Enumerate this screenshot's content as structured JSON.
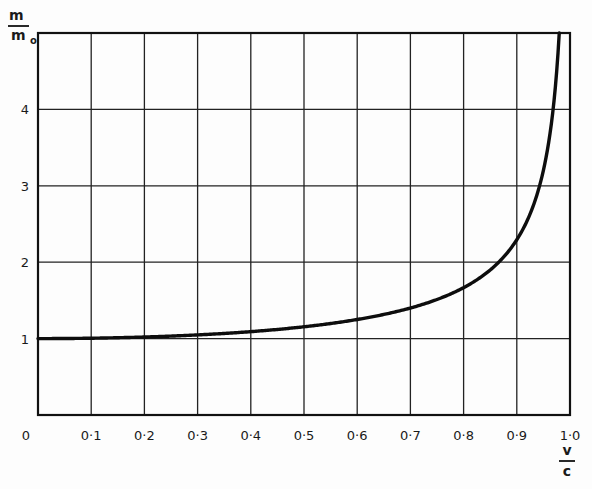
{
  "chart_data": {
    "type": "line",
    "title": "",
    "xlabel": {
      "numerator": "v",
      "denominator": "c"
    },
    "ylabel": {
      "numerator": "m",
      "denominator": "m",
      "denominator_subscript": "o"
    },
    "xlim": [
      0,
      1.0
    ],
    "ylim": [
      0,
      5
    ],
    "grid": true,
    "legend": null,
    "x_ticks": [
      {
        "value": 0,
        "label": "0"
      },
      {
        "value": 0.1,
        "label": "0·1"
      },
      {
        "value": 0.2,
        "label": "0·2"
      },
      {
        "value": 0.3,
        "label": "0·3"
      },
      {
        "value": 0.4,
        "label": "0·4"
      },
      {
        "value": 0.5,
        "label": "0·5"
      },
      {
        "value": 0.6,
        "label": "0·6"
      },
      {
        "value": 0.7,
        "label": "0·7"
      },
      {
        "value": 0.8,
        "label": "0·8"
      },
      {
        "value": 0.9,
        "label": "0·9"
      },
      {
        "value": 1.0,
        "label": "1·0"
      }
    ],
    "y_ticks": [
      {
        "value": 1,
        "label": "1"
      },
      {
        "value": 2,
        "label": "2"
      },
      {
        "value": 3,
        "label": "3"
      },
      {
        "value": 4,
        "label": "4"
      }
    ],
    "series": [
      {
        "name": "m/m0 = 1/sqrt(1 - v²/c²)",
        "color": "#111111",
        "x": [
          0,
          0.1,
          0.2,
          0.3,
          0.4,
          0.5,
          0.6,
          0.7,
          0.8,
          0.85,
          0.9,
          0.93,
          0.95,
          0.96,
          0.97,
          0.98
        ],
        "y": [
          1.0,
          1.005,
          1.021,
          1.048,
          1.091,
          1.155,
          1.25,
          1.4,
          1.667,
          1.898,
          2.294,
          2.721,
          3.203,
          3.571,
          4.113,
          5.025
        ]
      }
    ]
  }
}
